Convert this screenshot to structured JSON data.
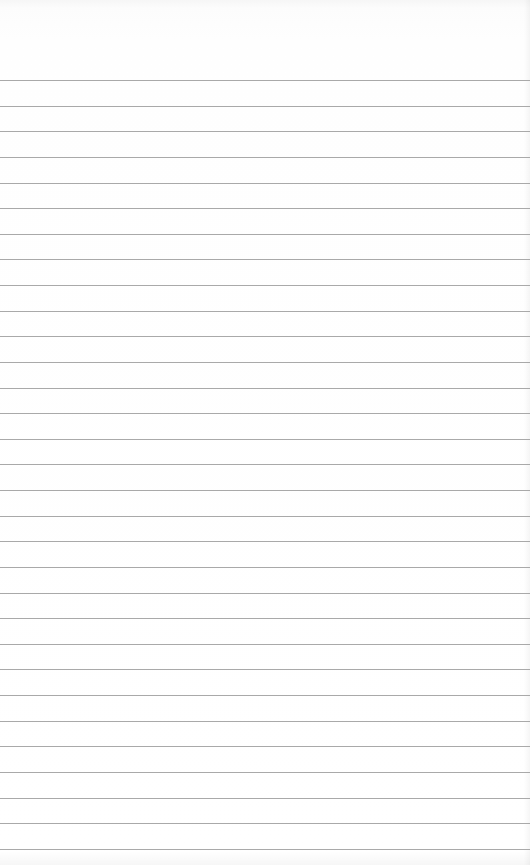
{
  "paper": {
    "type": "ruled-notepaper",
    "background_color": "#ffffff",
    "line_color": "#a9a9a9",
    "first_line_y": 80,
    "line_spacing": 25.63,
    "line_count": 31
  }
}
